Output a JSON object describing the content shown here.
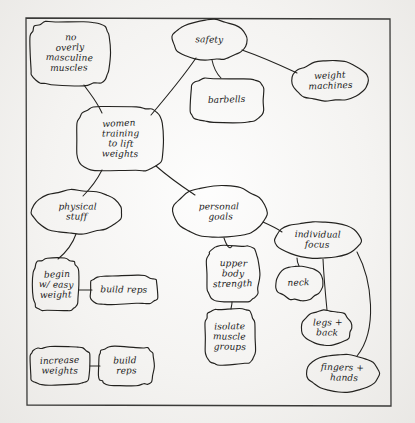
{
  "document": {
    "kind": "hand-drawn concept map",
    "medium": "ink on paper",
    "frame": {
      "label": "drawing-border"
    },
    "ink_color": "#23221f",
    "paper_color": "#f4f3f1"
  },
  "diagram": {
    "nodes": [
      {
        "id": "center",
        "lines": [
          "women",
          "training",
          "to lift",
          "weights"
        ],
        "shape": "rounded-rect",
        "x": 120,
        "y": 139,
        "rx": 43,
        "ry": 32
      },
      {
        "id": "no-masculine",
        "lines": [
          "no",
          "overly",
          "masculine",
          "muscles"
        ],
        "shape": "rounded-rect",
        "x": 70,
        "y": 53,
        "rx": 40,
        "ry": 32
      },
      {
        "id": "safety",
        "lines": [
          "safety"
        ],
        "shape": "ellipse",
        "x": 210,
        "y": 40,
        "rx": 38,
        "ry": 20
      },
      {
        "id": "barbells",
        "lines": [
          "barbells"
        ],
        "shape": "rounded-rect",
        "x": 227,
        "y": 100,
        "rx": 37,
        "ry": 22
      },
      {
        "id": "weight-machines",
        "lines": [
          "weight",
          "machines"
        ],
        "shape": "ellipse",
        "x": 330,
        "y": 81,
        "rx": 38,
        "ry": 20
      },
      {
        "id": "physical-stuff",
        "lines": [
          "physical",
          "stuff"
        ],
        "shape": "ellipse",
        "x": 77,
        "y": 212,
        "rx": 45,
        "ry": 22
      },
      {
        "id": "begin-easy",
        "lines": [
          "begin",
          "w/ easy",
          "weight"
        ],
        "shape": "rounded-rect",
        "x": 56,
        "y": 285,
        "rx": 23,
        "ry": 26
      },
      {
        "id": "build-reps-1",
        "lines": [
          "build reps"
        ],
        "shape": "rounded-rect",
        "x": 124,
        "y": 290,
        "rx": 34,
        "ry": 14
      },
      {
        "id": "increase-weights",
        "lines": [
          "increase",
          "weights"
        ],
        "shape": "rounded-rect",
        "x": 60,
        "y": 366,
        "rx": 30,
        "ry": 19
      },
      {
        "id": "build-reps-2",
        "lines": [
          "build",
          "reps"
        ],
        "shape": "rounded-rect",
        "x": 126,
        "y": 366,
        "rx": 28,
        "ry": 19
      },
      {
        "id": "personal-goals",
        "lines": [
          "personal",
          "goals"
        ],
        "shape": "ellipse",
        "x": 220,
        "y": 212,
        "rx": 47,
        "ry": 26
      },
      {
        "id": "upper-body",
        "lines": [
          "upper",
          "body",
          "strength"
        ],
        "shape": "rounded-rect",
        "x": 233,
        "y": 274,
        "rx": 26,
        "ry": 28
      },
      {
        "id": "isolate-muscle",
        "lines": [
          "isolate",
          "muscle",
          "groups"
        ],
        "shape": "rounded-rect",
        "x": 230,
        "y": 337,
        "rx": 25,
        "ry": 28
      },
      {
        "id": "individual-focus",
        "lines": [
          "individual",
          "focus"
        ],
        "shape": "ellipse",
        "x": 318,
        "y": 240,
        "rx": 43,
        "ry": 19
      },
      {
        "id": "neck",
        "lines": [
          "neck"
        ],
        "shape": "ellipse",
        "x": 299,
        "y": 283,
        "rx": 24,
        "ry": 17
      },
      {
        "id": "legs-back",
        "lines": [
          "legs +",
          "back"
        ],
        "shape": "ellipse",
        "x": 327,
        "y": 328,
        "rx": 25,
        "ry": 18
      },
      {
        "id": "fingers-hands",
        "lines": [
          "fingers +",
          "hands"
        ],
        "shape": "ellipse",
        "x": 343,
        "y": 373,
        "rx": 36,
        "ry": 19
      }
    ],
    "edges": [
      {
        "from": "center",
        "to": "no-masculine",
        "path": "M 102,113 C 96,100 90,94 84,85"
      },
      {
        "from": "center",
        "to": "safety",
        "path": "M 151,115 C 168,95 185,74 196,58"
      },
      {
        "from": "safety",
        "to": "barbells",
        "path": "M 212,60 C 214,70 217,74 221,78"
      },
      {
        "from": "safety",
        "to": "weight-machines",
        "path": "M 242,50 C 265,58 282,66 297,73"
      },
      {
        "from": "center",
        "to": "physical-stuff",
        "path": "M 102,170 C 96,182 89,190 83,196"
      },
      {
        "from": "center",
        "to": "personal-goals",
        "path": "M 156,166 C 172,180 186,189 195,195"
      },
      {
        "from": "physical-stuff",
        "to": "begin-easy",
        "path": "M 76,234 C 72,246 64,254 58,259"
      },
      {
        "from": "begin-easy",
        "to": "build-reps-1",
        "path": "M 79,290 C 85,290 88,290 92,290"
      },
      {
        "from": "increase-weights",
        "to": "build-reps-2",
        "path": "M 90,366 C 94,366 96,366 100,366"
      },
      {
        "from": "personal-goals",
        "to": "upper-body",
        "path": "M 224,238 C 227,247 230,250 232,246"
      },
      {
        "from": "upper-body",
        "to": "isolate-muscle",
        "path": "M 232,302 C 232,306 231,307 231,309"
      },
      {
        "from": "personal-goals",
        "to": "individual-focus",
        "path": "M 263,222 C 272,226 278,229 282,232"
      },
      {
        "from": "individual-focus",
        "to": "neck",
        "path": "M 297,258 C 297,262 298,264 299,266"
      },
      {
        "from": "individual-focus",
        "to": "legs-back",
        "path": "M 323,259 C 324,280 326,300 327,310"
      },
      {
        "from": "individual-focus",
        "to": "fingers-hands",
        "path": "M 357,252 C 372,280 378,330 357,356"
      }
    ]
  }
}
